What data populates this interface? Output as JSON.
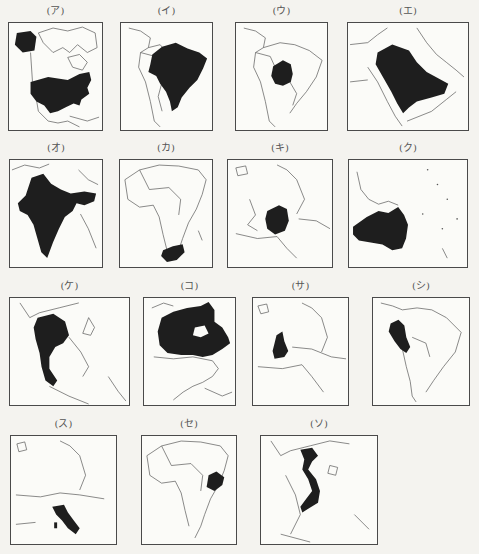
{
  "figure": {
    "panels": [
      {
        "label": "(ア)",
        "region": "North America",
        "highlighted": "United States"
      },
      {
        "label": "(イ)",
        "region": "South America",
        "highlighted": "Brazil"
      },
      {
        "label": "(ウ)",
        "region": "South America",
        "highlighted": "Bolivia"
      },
      {
        "label": "(エ)",
        "region": "Arabian Peninsula",
        "highlighted": "Saudi Arabia"
      },
      {
        "label": "(オ)",
        "region": "South Asia",
        "highlighted": "India"
      },
      {
        "label": "(カ)",
        "region": "Africa",
        "highlighted": "South Africa"
      },
      {
        "label": "(キ)",
        "region": "Europe",
        "highlighted": "Germany"
      },
      {
        "label": "(ク)",
        "region": "Oceania",
        "highlighted": "Australia"
      },
      {
        "label": "(ケ)",
        "region": "Southeast Asia",
        "highlighted": "Thailand"
      },
      {
        "label": "(コ)",
        "region": "North America",
        "highlighted": "Canada"
      },
      {
        "label": "(サ)",
        "region": "Europe",
        "highlighted": "United Kingdom"
      },
      {
        "label": "(シ)",
        "region": "South America",
        "highlighted": "Peru"
      },
      {
        "label": "(ス)",
        "region": "Europe",
        "highlighted": "Italy"
      },
      {
        "label": "(セ)",
        "region": "Africa",
        "highlighted": "Ethiopia"
      },
      {
        "label": "(ソ)",
        "region": "Southeast Asia",
        "highlighted": "Vietnam"
      }
    ]
  },
  "colors": {
    "highlight": "#1e1e1e",
    "border": "#4a4a4a",
    "map_bg": "#fbfbf8",
    "coast": "#555555"
  }
}
